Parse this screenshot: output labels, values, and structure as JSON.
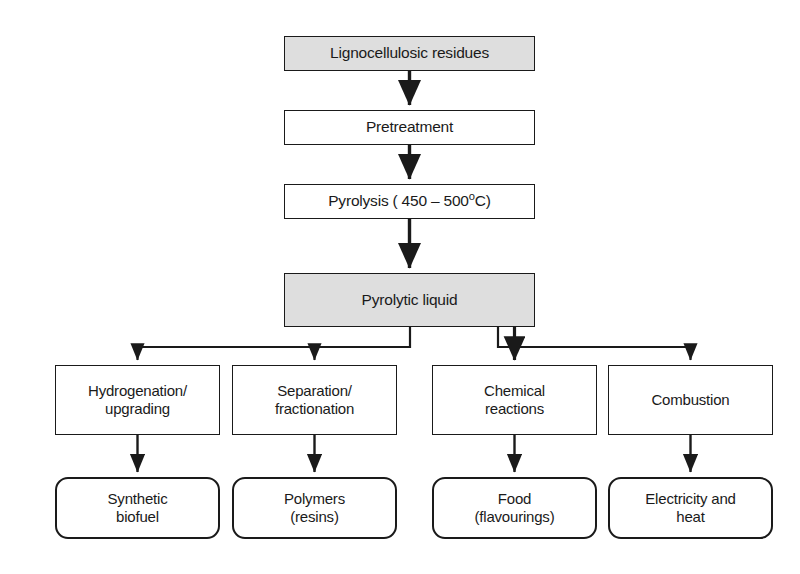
{
  "diagram": {
    "type": "process-flowchart",
    "background_color": "#ffffff",
    "line_color": "#1a1a1a",
    "shaded_fill": "#dedede",
    "plain_fill": "#ffffff"
  },
  "nodes": {
    "feedstock": {
      "label": "Lignocellulosic residues",
      "shape": "rectangle",
      "fill": "#dedede",
      "x": 284,
      "y": 36,
      "w": 251,
      "h": 35
    },
    "pretreatment": {
      "label": "Pretreatment",
      "shape": "rectangle",
      "fill": "#ffffff",
      "x": 284,
      "y": 110,
      "w": 251,
      "h": 35
    },
    "pyrolysis": {
      "label_prefix": "Pyrolysis ( 450 ",
      "label_dash": "–",
      "label_value": " 500",
      "label_degree": "o",
      "label_suffix": "C)",
      "label": "Pyrolysis ( 450 – 500°C)",
      "shape": "rectangle",
      "fill": "#ffffff",
      "x": 284,
      "y": 184,
      "w": 251,
      "h": 35
    },
    "pyrolytic_liquid": {
      "label": "Pyrolytic liquid",
      "shape": "rectangle",
      "fill": "#dedede",
      "x": 284,
      "y": 273,
      "w": 251,
      "h": 54
    },
    "stage1": {
      "label": "Hydrogenation/\nupgrading",
      "shape": "rectangle",
      "fill": "#ffffff",
      "x": 55,
      "y": 365,
      "w": 165,
      "h": 70
    },
    "stage2": {
      "label": "Separation/\nfractionation",
      "shape": "rectangle",
      "fill": "#ffffff",
      "x": 232,
      "y": 365,
      "w": 165,
      "h": 70
    },
    "stage3": {
      "label": "Chemical\nreactions",
      "shape": "rectangle",
      "fill": "#ffffff",
      "x": 432,
      "y": 365,
      "w": 165,
      "h": 70
    },
    "stage4": {
      "label": "Combustion",
      "shape": "rectangle",
      "fill": "#ffffff",
      "x": 608,
      "y": 365,
      "w": 165,
      "h": 70
    },
    "product1": {
      "label": "Synthetic\nbiofuel",
      "shape": "rounded-rectangle",
      "fill": "#ffffff",
      "x": 55,
      "y": 477,
      "w": 165,
      "h": 62
    },
    "product2": {
      "label": "Polymers\n(resins)",
      "shape": "rounded-rectangle",
      "fill": "#ffffff",
      "x": 232,
      "y": 477,
      "w": 165,
      "h": 62
    },
    "product3": {
      "label": "Food\n(flavourings)",
      "shape": "rounded-rectangle",
      "fill": "#ffffff",
      "x": 432,
      "y": 477,
      "w": 165,
      "h": 62
    },
    "product4": {
      "label": "Electricity and\nheat",
      "shape": "rounded-rectangle",
      "fill": "#ffffff",
      "x": 608,
      "y": 477,
      "w": 165,
      "h": 62
    }
  },
  "connectors": [
    {
      "name": "feedstock-to-pretreatment",
      "from": "feedstock",
      "to": "pretreatment",
      "kind": "straight-arrow"
    },
    {
      "name": "pretreatment-to-pyrolysis",
      "from": "pretreatment",
      "to": "pyrolysis",
      "kind": "straight-arrow"
    },
    {
      "name": "pyrolysis-to-pyrolytic-liquid",
      "from": "pyrolysis",
      "to": "pyrolytic_liquid",
      "kind": "straight-arrow"
    },
    {
      "name": "pyrolytic-liquid-to-stage1",
      "from": "pyrolytic_liquid",
      "to": "stage1",
      "kind": "elbow-arrow"
    },
    {
      "name": "pyrolytic-liquid-to-stage2",
      "from": "pyrolytic_liquid",
      "to": "stage2",
      "kind": "elbow-arrow"
    },
    {
      "name": "pyrolytic-liquid-to-stage3",
      "from": "pyrolytic_liquid",
      "to": "stage3",
      "kind": "straight-arrow"
    },
    {
      "name": "pyrolytic-liquid-to-stage4",
      "from": "pyrolytic_liquid",
      "to": "stage4",
      "kind": "elbow-arrow"
    },
    {
      "name": "stage1-to-product1",
      "from": "stage1",
      "to": "product1",
      "kind": "straight-arrow"
    },
    {
      "name": "stage2-to-product2",
      "from": "stage2",
      "to": "product2",
      "kind": "straight-arrow"
    },
    {
      "name": "stage3-to-product3",
      "from": "stage3",
      "to": "product3",
      "kind": "straight-arrow"
    },
    {
      "name": "stage4-to-product4",
      "from": "stage4",
      "to": "product4",
      "kind": "straight-arrow"
    }
  ]
}
